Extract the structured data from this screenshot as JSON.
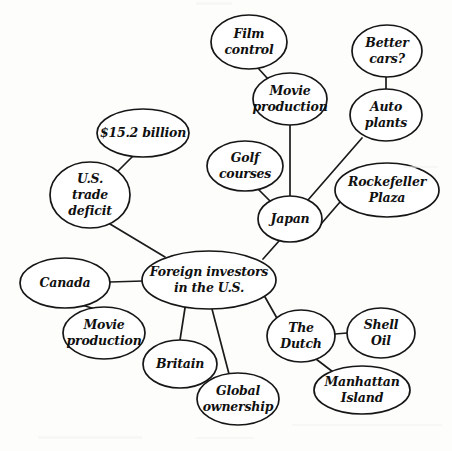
{
  "diagram": {
    "type": "concept-map",
    "style": {
      "background": "#fdfdfc",
      "stroke": "#161616",
      "node_fill": "#ffffff",
      "text_color": "#101010"
    },
    "nodes": [
      {
        "id": "hub",
        "label": "Foreign investors in the U.S.",
        "lines": [
          "Foreign investors",
          "in the U.S."
        ],
        "cx": 209,
        "cy": 280,
        "rx": 67,
        "ry": 29,
        "font_size": 12.5
      },
      {
        "id": "deficit",
        "label": "U.S. trade deficit",
        "lines": [
          "U.S.",
          "trade",
          "deficit"
        ],
        "cx": 90,
        "cy": 195,
        "rx": 40,
        "ry": 33,
        "font_size": 12.5
      },
      {
        "id": "billion",
        "label": "$15.2 billion",
        "lines": [
          "$15.2 billion"
        ],
        "cx": 143,
        "cy": 133,
        "rx": 46,
        "ry": 24,
        "font_size": 12.5
      },
      {
        "id": "canada",
        "label": "Canada",
        "lines": [
          "Canada"
        ],
        "cx": 65,
        "cy": 283,
        "rx": 45,
        "ry": 25,
        "font_size": 12.5
      },
      {
        "id": "movie_ca",
        "label": "Movie production",
        "lines": [
          "Movie",
          "production"
        ],
        "cx": 104,
        "cy": 333,
        "rx": 41,
        "ry": 26,
        "font_size": 12.5
      },
      {
        "id": "britain",
        "label": "Britain",
        "lines": [
          "Britain"
        ],
        "cx": 180,
        "cy": 364,
        "rx": 37,
        "ry": 24,
        "font_size": 12.5
      },
      {
        "id": "global",
        "label": "Global ownership",
        "lines": [
          "Global",
          "ownership"
        ],
        "cx": 238,
        "cy": 399,
        "rx": 41,
        "ry": 26,
        "font_size": 12.5
      },
      {
        "id": "dutch",
        "label": "The Dutch",
        "lines": [
          "The",
          "Dutch"
        ],
        "cx": 301,
        "cy": 336,
        "rx": 34,
        "ry": 26,
        "font_size": 12.5
      },
      {
        "id": "shell",
        "label": "Shell Oil",
        "lines": [
          "Shell",
          "Oil"
        ],
        "cx": 381,
        "cy": 333,
        "rx": 34,
        "ry": 25,
        "font_size": 12.5
      },
      {
        "id": "manhattan",
        "label": "Manhattan Island",
        "lines": [
          "Manhattan",
          "Island"
        ],
        "cx": 362,
        "cy": 390,
        "rx": 48,
        "ry": 24,
        "font_size": 12.5
      },
      {
        "id": "japan",
        "label": "Japan",
        "lines": [
          "Japan"
        ],
        "cx": 290,
        "cy": 219,
        "rx": 32,
        "ry": 23,
        "font_size": 12.5
      },
      {
        "id": "golf",
        "label": "Golf courses",
        "lines": [
          "Golf",
          "courses"
        ],
        "cx": 245,
        "cy": 166,
        "rx": 38,
        "ry": 25,
        "font_size": 12.5
      },
      {
        "id": "movie_jp",
        "label": "Movie production",
        "lines": [
          "Movie",
          "production"
        ],
        "cx": 290,
        "cy": 99,
        "rx": 37,
        "ry": 26,
        "font_size": 12.5
      },
      {
        "id": "film",
        "label": "Film control",
        "lines": [
          "Film",
          "control"
        ],
        "cx": 249,
        "cy": 42,
        "rx": 38,
        "ry": 27,
        "font_size": 12.5
      },
      {
        "id": "cars",
        "label": "Better cars?",
        "lines": [
          "Better",
          "cars?"
        ],
        "cx": 387,
        "cy": 51,
        "rx": 35,
        "ry": 26,
        "font_size": 12.5
      },
      {
        "id": "auto",
        "label": "Auto plants",
        "lines": [
          "Auto",
          "plants"
        ],
        "cx": 386,
        "cy": 115,
        "rx": 36,
        "ry": 26,
        "font_size": 12.5
      },
      {
        "id": "rockefeller",
        "label": "Rockefeller Plaza",
        "lines": [
          "Rockefeller",
          "Plaza"
        ],
        "cx": 387,
        "cy": 190,
        "rx": 52,
        "ry": 27,
        "font_size": 12.5
      }
    ],
    "edges": [
      {
        "from": "hub",
        "to": "deficit",
        "x1": 165,
        "y1": 257,
        "x2": 110,
        "y2": 224
      },
      {
        "from": "deficit",
        "to": "billion",
        "x1": 117,
        "y1": 172,
        "x2": 133,
        "y2": 156
      },
      {
        "from": "hub",
        "to": "canada",
        "x1": 143,
        "y1": 281,
        "x2": 110,
        "y2": 282
      },
      {
        "from": "canada",
        "to": "movie_ca",
        "x1": 82,
        "y1": 305,
        "x2": 95,
        "y2": 309
      },
      {
        "from": "hub",
        "to": "britain",
        "x1": 185,
        "y1": 308,
        "x2": 180,
        "y2": 340
      },
      {
        "from": "hub",
        "to": "global",
        "x1": 212,
        "y1": 309,
        "x2": 229,
        "y2": 374
      },
      {
        "from": "hub",
        "to": "dutch",
        "x1": 265,
        "y1": 297,
        "x2": 278,
        "y2": 320
      },
      {
        "from": "dutch",
        "to": "shell",
        "x1": 335,
        "y1": 334,
        "x2": 347,
        "y2": 333
      },
      {
        "from": "dutch",
        "to": "manhattan",
        "x1": 316,
        "y1": 359,
        "x2": 333,
        "y2": 372
      },
      {
        "from": "hub",
        "to": "japan",
        "x1": 263,
        "y1": 259,
        "x2": 279,
        "y2": 241
      },
      {
        "from": "japan",
        "to": "golf",
        "x1": 271,
        "y1": 202,
        "x2": 258,
        "y2": 189
      },
      {
        "from": "japan",
        "to": "movie_jp",
        "x1": 290,
        "y1": 196,
        "x2": 290,
        "y2": 125
      },
      {
        "from": "movie_jp",
        "to": "film",
        "x1": 268,
        "y1": 79,
        "x2": 258,
        "y2": 68
      },
      {
        "from": "japan",
        "to": "auto",
        "x1": 308,
        "y1": 200,
        "x2": 362,
        "y2": 138
      },
      {
        "from": "auto",
        "to": "cars",
        "x1": 386,
        "y1": 89,
        "x2": 386,
        "y2": 77
      },
      {
        "from": "japan",
        "to": "rockefeller",
        "x1": 321,
        "y1": 224,
        "x2": 340,
        "y2": 202
      }
    ]
  }
}
